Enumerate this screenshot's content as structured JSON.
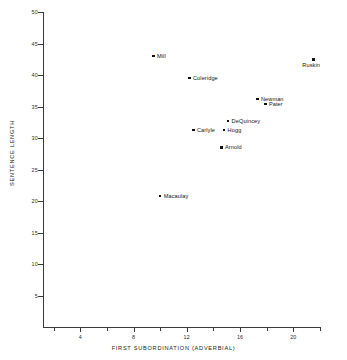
{
  "chart_data": {
    "type": "scatter",
    "title": "",
    "xlabel": "FIRST SUBORDINATION (ADVERBIAL)",
    "ylabel": "SENTENCE LENGTH",
    "xlim": [
      0,
      22
    ],
    "ylim": [
      0,
      50
    ],
    "grid": false,
    "legend": "none",
    "xticks": [
      4,
      8,
      12,
      16,
      20
    ],
    "xticks_labels": [
      "4",
      "8",
      "12",
      "16",
      "20"
    ],
    "xticks_minor": [
      2,
      6,
      10,
      14,
      18,
      22
    ],
    "yticks": [
      5,
      10,
      15,
      20,
      25,
      30,
      35,
      40,
      45,
      50
    ],
    "yticks_labels": [
      "5",
      "10",
      "15",
      "20",
      "25",
      "30",
      "35",
      "40",
      "45",
      "50"
    ],
    "points": [
      {
        "label": "Mill",
        "x": 9.5,
        "y": 43.0,
        "label_pos": "right"
      },
      {
        "label": "Coleridge",
        "x": 12.2,
        "y": 39.5,
        "label_pos": "right"
      },
      {
        "label": "Ruskin",
        "x": 21.5,
        "y": 42.5,
        "label_pos": "below"
      },
      {
        "label": "Newman",
        "x": 17.3,
        "y": 36.2,
        "label_pos": "right"
      },
      {
        "label": "Pater",
        "x": 17.9,
        "y": 35.4,
        "label_pos": "right"
      },
      {
        "label": "DeQuincey",
        "x": 15.1,
        "y": 32.7,
        "label_pos": "right"
      },
      {
        "label": "Carlyle",
        "x": 12.5,
        "y": 31.3,
        "label_pos": "right"
      },
      {
        "label": "Hogg",
        "x": 14.8,
        "y": 31.3,
        "label_pos": "right"
      },
      {
        "label": "Arnold",
        "x": 14.6,
        "y": 28.5,
        "label_pos": "right"
      },
      {
        "label": "Macaulay",
        "x": 10.0,
        "y": 20.8,
        "label_pos": "right"
      }
    ]
  },
  "colors": {
    "marker": "#111111",
    "axis": "#3a3a3a",
    "text": "#1a1a1a",
    "background": "#ffffff"
  }
}
